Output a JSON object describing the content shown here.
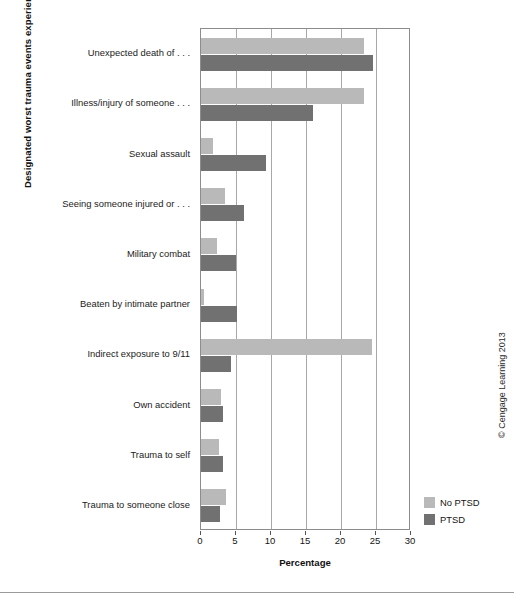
{
  "chart_data": {
    "type": "bar",
    "orientation": "horizontal",
    "title": "",
    "xlabel": "Percentage",
    "ylabel": "Designated worst trauma events experienced by respondents",
    "xlim": [
      0,
      30
    ],
    "xticks": [
      0,
      5,
      10,
      15,
      20,
      25,
      30
    ],
    "grid": true,
    "legend_position": "bottom-right",
    "categories": [
      "Unexpected death of . . .",
      "Illness/injury of someone . . .",
      "Sexual assault",
      "Seeing someone injured or . . .",
      "Military combat",
      "Beaten by intimate partner",
      "Indirect exposure to 9/11",
      "Own accident",
      "Trauma to self",
      "Trauma to someone close"
    ],
    "series": [
      {
        "name": "No PTSD",
        "color": "#b9b9b9",
        "values": [
          23.3,
          23.3,
          1.7,
          3.4,
          2.3,
          0.4,
          24.4,
          2.9,
          2.6,
          3.5
        ]
      },
      {
        "name": "PTSD",
        "color": "#717171",
        "values": [
          24.6,
          16.0,
          9.3,
          6.2,
          5.0,
          5.1,
          4.3,
          3.2,
          3.2,
          2.7
        ]
      }
    ]
  },
  "legend": {
    "items": [
      {
        "label": "No PTSD",
        "color": "#b9b9b9"
      },
      {
        "label": "PTSD",
        "color": "#717171"
      }
    ]
  },
  "credit": "© Cengage Learning 2013"
}
